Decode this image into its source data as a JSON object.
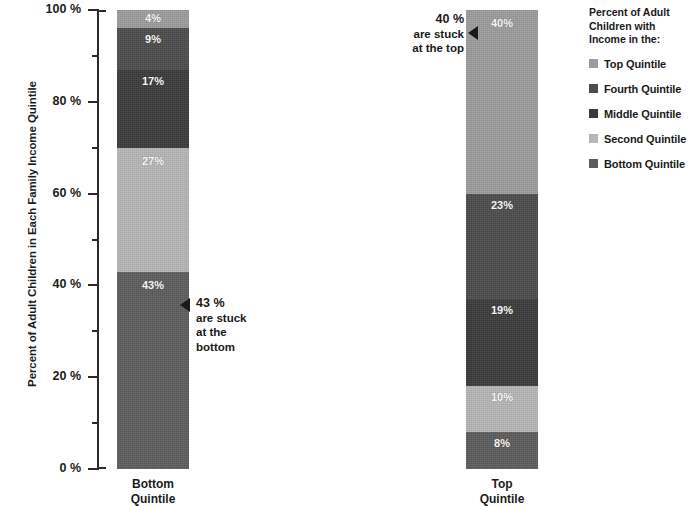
{
  "chart_data": {
    "type": "bar",
    "subtype": "100% stacked column",
    "title": "",
    "xlabel": "",
    "ylabel": "Percent of Adult Children in Each Family Income Quintile",
    "ylim": [
      0,
      100
    ],
    "yunit": "%",
    "grid": false,
    "legend_position": "right",
    "categories": [
      "Bottom Quintile",
      "Top Quintile"
    ],
    "series": [
      {
        "name": "Top Quintile",
        "color": "#9c9c9c",
        "values": [
          4,
          40
        ]
      },
      {
        "name": "Fourth Quintile",
        "color": "#4c4c4c",
        "values": [
          9,
          23
        ]
      },
      {
        "name": "Middle Quintile",
        "color": "#3a3a3a",
        "values": [
          17,
          19
        ]
      },
      {
        "name": "Second Quintile",
        "color": "#b6b6b6",
        "values": [
          27,
          10
        ]
      },
      {
        "name": "Bottom Quintile",
        "color": "#5c5c5c",
        "values": [
          43,
          8
        ]
      }
    ],
    "ytick_labels": [
      "0 %",
      "20 %",
      "40 %",
      "60 %",
      "80 %",
      "100 %"
    ],
    "ytick_values": [
      0,
      20,
      40,
      60,
      80,
      100
    ],
    "yminor_values": [
      10,
      30,
      50,
      70,
      90
    ],
    "annotations": [
      {
        "id": "bottom",
        "value": "43 %",
        "lines": [
          "are stuck",
          "at the",
          "bottom"
        ]
      },
      {
        "id": "top",
        "value": "40 %",
        "lines": [
          "are stuck",
          "at the top"
        ]
      }
    ]
  },
  "axis": {
    "label": "Percent of Adult Children in Each Family Income Quintile",
    "ticks": [
      {
        "label": "100 %",
        "value": 100
      },
      {
        "label": "80 %",
        "value": 80
      },
      {
        "label": "60 %",
        "value": 60
      },
      {
        "label": "40 %",
        "value": 40
      },
      {
        "label": "20 %",
        "value": 20
      },
      {
        "label": "0 %",
        "value": 0
      }
    ]
  },
  "bars": {
    "left": {
      "category": "Bottom",
      "category_line2": "Quintile",
      "segments": [
        {
          "name": "Top Quintile",
          "label": "4%",
          "value": 4,
          "color": "#9c9c9c"
        },
        {
          "name": "Fourth Quintile",
          "label": "9%",
          "value": 9,
          "color": "#4c4c4c"
        },
        {
          "name": "Middle Quintile",
          "label": "17%",
          "value": 17,
          "color": "#3a3a3a"
        },
        {
          "name": "Second Quintile",
          "label": "27%",
          "value": 27,
          "color": "#b6b6b6"
        },
        {
          "name": "Bottom Quintile",
          "label": "43%",
          "value": 43,
          "color": "#5c5c5c"
        }
      ]
    },
    "right": {
      "category": "Top",
      "category_line2": "Quintile",
      "segments": [
        {
          "name": "Top Quintile",
          "label": "40%",
          "value": 40,
          "color": "#9c9c9c"
        },
        {
          "name": "Fourth Quintile",
          "label": "23%",
          "value": 23,
          "color": "#4c4c4c"
        },
        {
          "name": "Middle Quintile",
          "label": "19%",
          "value": 19,
          "color": "#3a3a3a"
        },
        {
          "name": "Second Quintile",
          "label": "10%",
          "value": 10,
          "color": "#b6b6b6"
        },
        {
          "name": "Bottom Quintile",
          "label": "8%",
          "value": 8,
          "color": "#5c5c5c"
        }
      ]
    }
  },
  "callouts": {
    "bottom": {
      "value": "43 %",
      "line1": "are stuck",
      "line2": "at the",
      "line3": "bottom"
    },
    "top": {
      "value": "40 %",
      "line1": "are stuck",
      "line2": "at the top"
    }
  },
  "legend": {
    "title_line1": "Percent of Adult",
    "title_line2": "Children with",
    "title_line3": "Income in the:",
    "items": [
      {
        "label": "Top Quintile",
        "color": "#9c9c9c"
      },
      {
        "label": "Fourth Quintile",
        "color": "#4c4c4c"
      },
      {
        "label": "Middle Quintile",
        "color": "#3a3a3a"
      },
      {
        "label": "Second Quintile",
        "color": "#b6b6b6"
      },
      {
        "label": "Bottom Quintile",
        "color": "#5c5c5c"
      }
    ]
  }
}
